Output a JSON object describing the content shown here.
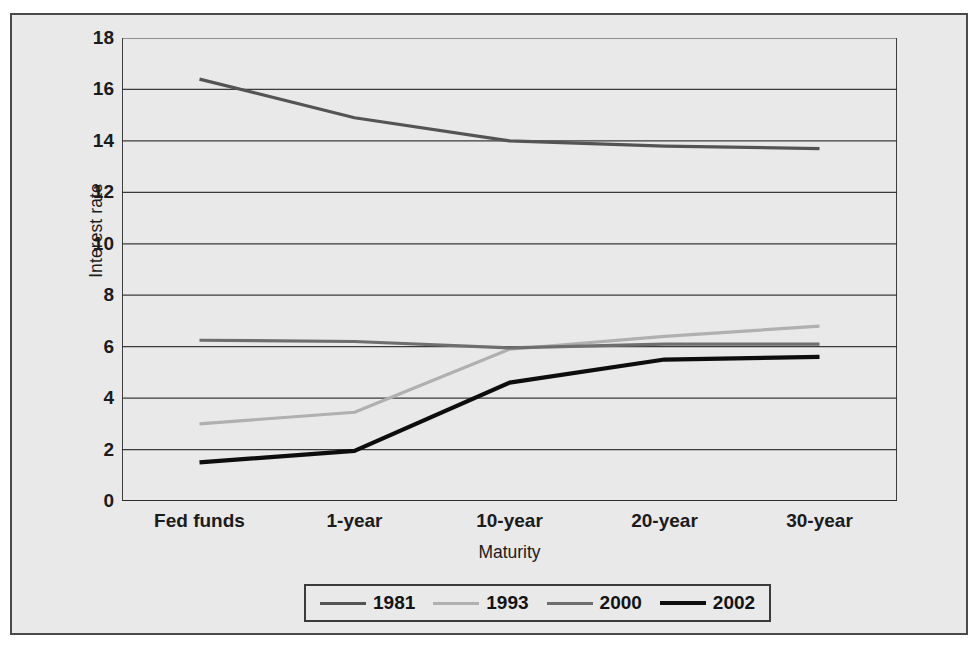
{
  "figure": {
    "top_cut_text": "",
    "background_color": "#e9e9e9",
    "frame_color": "#4a4a4a"
  },
  "chart_data": {
    "type": "line",
    "title": "",
    "xlabel": "Maturity",
    "ylabel": "Interest rate",
    "categories": [
      "Fed funds",
      "1-year",
      "10-year",
      "20-year",
      "30-year"
    ],
    "ylim": [
      0,
      18
    ],
    "ytick_step": 2,
    "yticks": [
      18,
      16,
      14,
      12,
      10,
      8,
      6,
      4,
      2,
      0
    ],
    "grid": "horizontal",
    "legend_position": "bottom-center",
    "series": [
      {
        "name": "1981",
        "color": "#545454",
        "width": 3.2,
        "values": [
          16.4,
          14.9,
          14.0,
          13.8,
          13.7
        ]
      },
      {
        "name": "1993",
        "color": "#b0b0b0",
        "width": 3.2,
        "values": [
          3.0,
          3.45,
          5.9,
          6.4,
          6.8
        ]
      },
      {
        "name": "2000",
        "color": "#6e6e6e",
        "width": 3.2,
        "values": [
          6.25,
          6.2,
          5.95,
          6.1,
          6.1
        ]
      },
      {
        "name": "2002",
        "color": "#0d0d0d",
        "width": 4.2,
        "values": [
          1.5,
          1.95,
          4.6,
          5.5,
          5.6
        ]
      }
    ]
  }
}
